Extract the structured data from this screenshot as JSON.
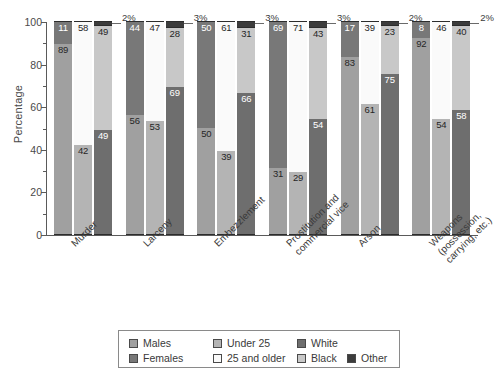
{
  "chart_data": {
    "type": "bar",
    "subtype": "grouped-stacked-100-percent",
    "title": "",
    "xlabel": "",
    "ylabel": "Percentage",
    "ylim": [
      0,
      100
    ],
    "yticks": [
      0,
      20,
      40,
      60,
      80,
      100
    ],
    "yticks_minor": [
      10,
      30,
      50,
      70,
      90
    ],
    "grid": false,
    "legend_position": "bottom",
    "categories": [
      "Murder",
      "Larceny",
      "Embezzlement",
      "Prostitution and\ncommercial vice",
      "Arson",
      "Weapons\n(possession,\ncarrying, etc.)"
    ],
    "stacks": [
      {
        "name": "sex",
        "series": [
          {
            "name": "Males",
            "color": "#a0a0a0",
            "values": [
              89,
              56,
              50,
              31,
              83,
              92
            ]
          },
          {
            "name": "Females",
            "color": "#787878",
            "values": [
              11,
              44,
              50,
              69,
              17,
              8
            ]
          }
        ]
      },
      {
        "name": "age",
        "series": [
          {
            "name": "Under 25",
            "color": "#b4b4b4",
            "values": [
              42,
              53,
              39,
              29,
              61,
              54
            ]
          },
          {
            "name": "25 and older",
            "color": "#fafafa",
            "values": [
              58,
              47,
              61,
              71,
              39,
              46
            ]
          }
        ]
      },
      {
        "name": "race",
        "series": [
          {
            "name": "White",
            "color": "#6e6e6e",
            "values": [
              49,
              69,
              66,
              54,
              75,
              58
            ]
          },
          {
            "name": "Black",
            "color": "#c8c8c8",
            "values": [
              49,
              28,
              31,
              43,
              23,
              40
            ]
          },
          {
            "name": "Other",
            "color": "#3c3c3c",
            "values": [
              2,
              3,
              3,
              3,
              2,
              2
            ]
          }
        ]
      }
    ],
    "other_callouts": [
      "2%",
      "3%",
      "3%",
      "3%",
      "2%",
      "2%"
    ]
  },
  "axis": {
    "y_title": "Percentage",
    "y_tick_labels": [
      "0",
      "20",
      "40",
      "60",
      "80",
      "100"
    ]
  },
  "legend": {
    "entries": [
      {
        "label": "Males",
        "color": "#a0a0a0"
      },
      {
        "label": "Females",
        "color": "#787878"
      },
      {
        "label": "Under 25",
        "color": "#b4b4b4"
      },
      {
        "label": "25 and older",
        "color": "#fafafa"
      },
      {
        "label": "White",
        "color": "#6e6e6e"
      },
      {
        "label": "Black",
        "color": "#c8c8c8"
      },
      {
        "label": "Other",
        "color": "#3c3c3c"
      }
    ]
  }
}
